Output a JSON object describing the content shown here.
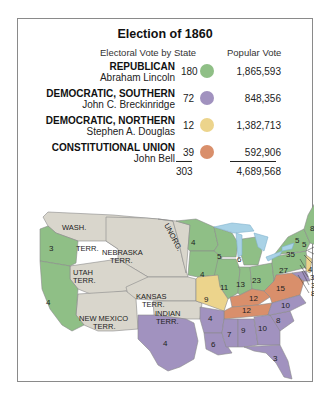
{
  "title": "Election of 1860",
  "headers": {
    "electoral": "Electoral Vote by State",
    "popular": "Popular Vote"
  },
  "colors": {
    "republican": "#8fbf86",
    "southern_democratic": "#a192bf",
    "northern_democratic": "#ecd48c",
    "constitutional_union": "#d98f6b",
    "territory": "#d9d6cc",
    "water": "#a9d2e6",
    "border": "#8a8a8a"
  },
  "parties": [
    {
      "party": "REPUBLICAN",
      "candidate": "Abraham Lincoln",
      "electoral": "180",
      "popular": "1,865,593",
      "color": "#8fbf86"
    },
    {
      "party": "DEMOCRATIC, SOUTHERN",
      "candidate": "John C. Breckinridge",
      "electoral": "72",
      "popular": "848,356",
      "color": "#a192bf"
    },
    {
      "party": "DEMOCRATIC, NORTHERN",
      "candidate": "Stephen A. Douglas",
      "electoral": "12",
      "popular": "1,382,713",
      "color": "#ecd48c"
    },
    {
      "party": "CONSTITUTIONAL UNION",
      "candidate": "John Bell",
      "electoral": "39",
      "popular": "592,906",
      "color": "#d98f6b"
    }
  ],
  "totals": {
    "electoral": "303",
    "popular": "4,689,568"
  },
  "map": {
    "territories": {
      "wash": "WASH.",
      "wash_terr": "TERR.",
      "nebraska": "NEBRASKA",
      "nebraska_terr": "TERR.",
      "unorg": "UNORG.",
      "utah": "UTAH",
      "utah_terr": "TERR.",
      "kansas": "KANSAS",
      "kansas_terr": "TERR.",
      "new_mexico": "NEW MEXICO",
      "new_mexico_terr": "TERR.",
      "indian": "INDIAN",
      "indian_terr": "TERR."
    },
    "state_votes": {
      "oregon": "3",
      "california": "4",
      "minnesota": "4",
      "wisconsin": "5",
      "michigan": "6",
      "iowa": "4",
      "illinois": "11",
      "indiana": "13",
      "ohio": "23",
      "pennsylvania": "27",
      "new_york": "35",
      "vermont": "5",
      "new_hampshire": "5",
      "maine": "8",
      "massachusetts": "13",
      "rhode_island": "4",
      "connecticut": "6",
      "new_jersey_r": "4",
      "new_jersey_d": "3",
      "delaware": "3",
      "maryland": "8",
      "missouri": "9",
      "kentucky": "12",
      "tennessee": "12",
      "virginia": "15",
      "texas": "4",
      "arkansas": "4",
      "louisiana": "6",
      "mississippi": "7",
      "alabama": "9",
      "georgia": "10",
      "south_carolina": "8",
      "north_carolina": "10",
      "florida": "3"
    }
  }
}
